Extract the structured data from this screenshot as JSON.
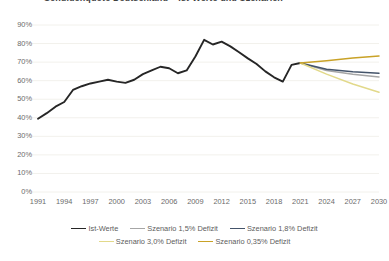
{
  "chart_data": {
    "type": "line",
    "title": "Schuldenquote Deutschland – Ist-Werte und Szenarien",
    "xlabel": "",
    "ylabel": "",
    "grid": true,
    "legend_position": "bottom",
    "xlim": [
      1991,
      2030
    ],
    "ylim": [
      0,
      90
    ],
    "y_ticks": [
      "0%",
      "10%",
      "20%",
      "30%",
      "40%",
      "50%",
      "60%",
      "70%",
      "80%",
      "90%"
    ],
    "y_tick_values": [
      0,
      10,
      20,
      30,
      40,
      50,
      60,
      70,
      80,
      90
    ],
    "x_ticks": [
      "1991",
      "1994",
      "1997",
      "2000",
      "2003",
      "2006",
      "2009",
      "2012",
      "2015",
      "2018",
      "2021",
      "2024",
      "2027",
      "2030"
    ],
    "x_tick_values": [
      1991,
      1994,
      1997,
      2000,
      2003,
      2006,
      2009,
      2012,
      2015,
      2018,
      2021,
      2024,
      2027,
      2030
    ],
    "series": [
      {
        "name": "Ist-Werte",
        "color": "#262626",
        "x": [
          1991,
          1992,
          1993,
          1994,
          1995,
          1996,
          1997,
          1998,
          1999,
          2000,
          2001,
          2002,
          2003,
          2004,
          2005,
          2006,
          2007,
          2008,
          2009,
          2010,
          2011,
          2012,
          2013,
          2014,
          2015,
          2016,
          2017,
          2018,
          2019,
          2020,
          2021
        ],
        "values": [
          39.5,
          42.5,
          46.0,
          48.5,
          55.0,
          57.0,
          58.5,
          59.5,
          60.5,
          59.5,
          58.8,
          60.5,
          63.5,
          65.5,
          67.5,
          66.7,
          64.0,
          65.5,
          73.0,
          82.0,
          79.5,
          81.0,
          78.5,
          75.3,
          72.0,
          69.0,
          65.0,
          61.8,
          59.5,
          68.5,
          69.5
        ]
      },
      {
        "name": "Szenario 1,5% Defizit",
        "color": "#a6a6a6",
        "x": [
          2021,
          2024,
          2027,
          2030
        ],
        "values": [
          69.5,
          65.5,
          63.4,
          62.0
        ]
      },
      {
        "name": "Szenario 1,8% Defizit",
        "color": "#44546a",
        "x": [
          2021,
          2024,
          2027,
          2030
        ],
        "values": [
          69.5,
          66.2,
          64.8,
          64.0
        ]
      },
      {
        "name": "Szenario 3,0% Defizit",
        "color": "#e2d98a",
        "x": [
          2021,
          2024,
          2027,
          2030
        ],
        "values": [
          69.5,
          63.5,
          58.2,
          53.8
        ]
      },
      {
        "name": "Szenario 0,35% Defizit",
        "color": "#c9a227",
        "x": [
          2021,
          2024,
          2027,
          2030
        ],
        "values": [
          69.5,
          70.8,
          72.2,
          73.3
        ]
      }
    ]
  },
  "legend": {
    "row1": [
      {
        "label": "Ist-Werte",
        "color": "#262626"
      },
      {
        "label": "Szenario 1,5% Defizit",
        "color": "#a6a6a6"
      },
      {
        "label": "Szenario 1,8% Defizit",
        "color": "#44546a"
      }
    ],
    "row2": [
      {
        "label": "Szenario 3,0% Defizit",
        "color": "#e2d98a"
      },
      {
        "label": "Szenario 0,35% Defizit",
        "color": "#c9a227"
      }
    ]
  }
}
